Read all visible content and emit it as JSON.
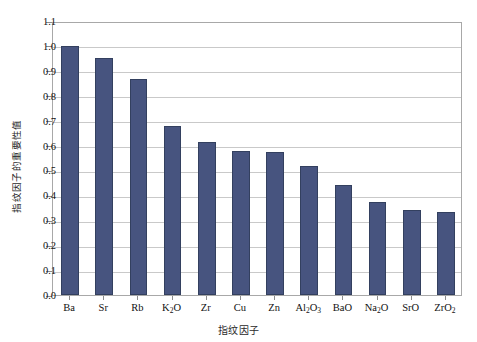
{
  "chart_data": {
    "type": "bar",
    "title": "",
    "xlabel": "指纹因子",
    "ylabel": "指纹因子的重要性值",
    "categories": [
      "Ba",
      "Sr",
      "Rb",
      "K₂O",
      "Zr",
      "Cu",
      "Zn",
      "Al₂O₃",
      "BaO",
      "Na₂O",
      "SrO",
      "ZrO₂"
    ],
    "category_parts": [
      {
        "base": "Ba",
        "sub": "",
        "tail": ""
      },
      {
        "base": "Sr",
        "sub": "",
        "tail": ""
      },
      {
        "base": "Rb",
        "sub": "",
        "tail": ""
      },
      {
        "base": "K",
        "sub": "2",
        "tail": "O"
      },
      {
        "base": "Zr",
        "sub": "",
        "tail": ""
      },
      {
        "base": "Cu",
        "sub": "",
        "tail": ""
      },
      {
        "base": "Zn",
        "sub": "",
        "tail": ""
      },
      {
        "base": "Al",
        "sub": "2",
        "tail": "O",
        "sub2": "3"
      },
      {
        "base": "BaO",
        "sub": "",
        "tail": ""
      },
      {
        "base": "Na",
        "sub": "2",
        "tail": "O"
      },
      {
        "base": "SrO",
        "sub": "",
        "tail": ""
      },
      {
        "base": "ZrO",
        "sub": "2",
        "tail": ""
      }
    ],
    "values": [
      1.0,
      0.95,
      0.867,
      0.678,
      0.613,
      0.578,
      0.575,
      0.518,
      0.443,
      0.373,
      0.343,
      0.333
    ],
    "ylim": [
      0.0,
      1.1
    ],
    "ytick_step": 0.1,
    "yticks": [
      "0.0",
      "0.1",
      "0.2",
      "0.3",
      "0.4",
      "0.5",
      "0.6",
      "0.7",
      "0.8",
      "0.9",
      "1.0",
      "1.1"
    ],
    "grid": "horizontal",
    "legend": "none",
    "bar_color": "#47547f",
    "bar_edge_color": "#33405f",
    "gridline_color": "#c9c9c9",
    "axis_color": "#a8a8a8",
    "plot_background": "#ffffff"
  }
}
